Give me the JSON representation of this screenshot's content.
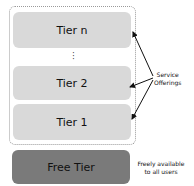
{
  "diagram": {
    "tiers": [
      {
        "label": "Tier n"
      },
      {
        "label": "Tier 2"
      },
      {
        "label": "Tier 1"
      }
    ],
    "ellipsis": "⋮",
    "free_tier": {
      "label": "Free Tier"
    },
    "annotations": {
      "service_offerings_line1": "Service",
      "service_offerings_line2": "Offerings",
      "free_line1": "Freely available",
      "free_line2": "to all users"
    },
    "colors": {
      "tier_fill": "#d9d9d9",
      "free_fill": "#7a7a7a",
      "border": "#9a9a9a"
    }
  }
}
